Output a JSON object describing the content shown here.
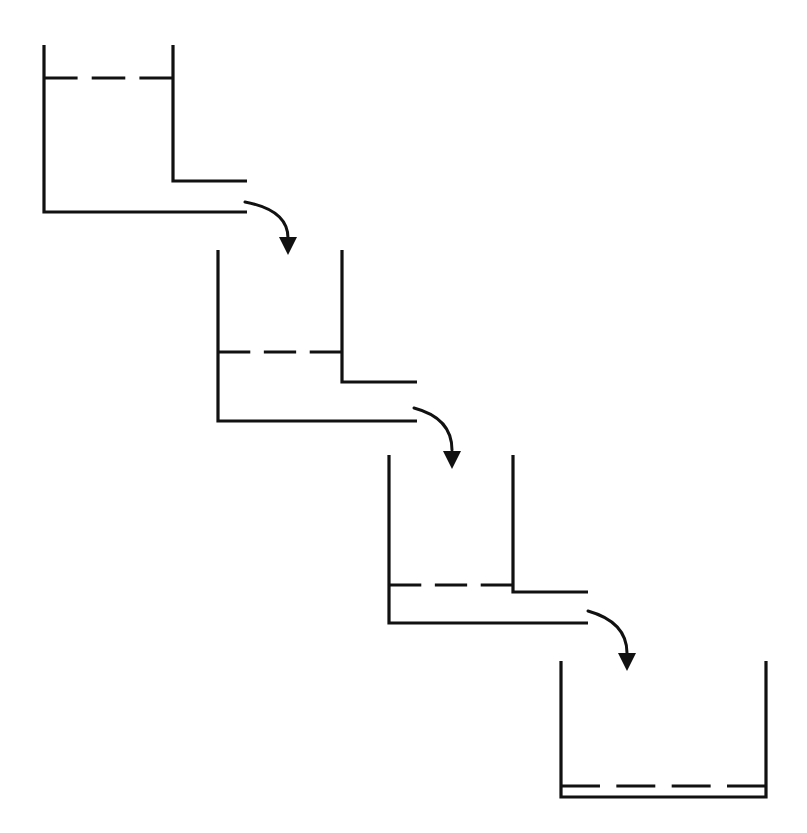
{
  "figure": {
    "type": "technical-line-diagram",
    "background_color": "#ffffff",
    "ink_color": "#111111",
    "width": 807,
    "height": 833
  },
  "style": {
    "wall_stroke_width": 3.2,
    "level_stroke_width": 3.2,
    "arrow_stroke_width": 3.0,
    "dash_pattern": "38 18"
  },
  "vessels": [
    {
      "id": "vessel-1",
      "label": "Vessel 1",
      "position": "top-left",
      "left_wall_x": 44,
      "right_wall_x": 173,
      "top_y": 45,
      "bottom_y": 212,
      "right_wall_bottom_y": 181,
      "spout_y": 181,
      "spout_end_x": 247,
      "bottom_end_x": 247,
      "level_y": 78,
      "level_dash_count": 3,
      "fill_depth_px": 134
    },
    {
      "id": "vessel-2",
      "label": "Vessel 2",
      "position": "upper-middle",
      "left_wall_x": 218,
      "right_wall_x": 342,
      "top_y": 250,
      "bottom_y": 421,
      "right_wall_bottom_y": 382,
      "spout_y": 382,
      "spout_end_x": 417,
      "bottom_end_x": 417,
      "level_y": 352,
      "level_dash_count": 3,
      "fill_depth_px": 69
    },
    {
      "id": "vessel-3",
      "label": "Vessel 3",
      "position": "lower-middle",
      "left_wall_x": 389,
      "right_wall_x": 513,
      "top_y": 455,
      "bottom_y": 623,
      "right_wall_bottom_y": 592,
      "spout_y": 592,
      "spout_end_x": 588,
      "bottom_end_x": 588,
      "level_y": 585,
      "level_dash_count": 3,
      "fill_depth_px": 38
    },
    {
      "id": "vessel-4",
      "label": "Vessel 4",
      "position": "bottom-right",
      "left_wall_x": 561,
      "right_wall_x": 766,
      "top_y": 661,
      "bottom_y": 797,
      "right_wall_bottom_y": 797,
      "spout_y": null,
      "spout_end_x": null,
      "bottom_end_x": 766,
      "level_y": 786,
      "level_dash_count": 4,
      "fill_depth_px": 11
    }
  ],
  "flow_arrows": [
    {
      "id": "flow-arrow-1",
      "label": "Flow from vessel 1 to vessel 2",
      "start_x": 245,
      "start_y": 202,
      "control_x": 288,
      "control_y": 210,
      "end_x": 288,
      "end_y": 238,
      "tip_x": 288,
      "tip_y": 255,
      "head_half_width": 9,
      "head_length": 18
    },
    {
      "id": "flow-arrow-2",
      "label": "Flow from vessel 2 to vessel 3",
      "start_x": 414,
      "start_y": 408,
      "control_x": 452,
      "control_y": 418,
      "end_x": 452,
      "end_y": 450,
      "tip_x": 452,
      "tip_y": 469,
      "head_half_width": 9,
      "head_length": 18
    },
    {
      "id": "flow-arrow-3",
      "label": "Flow from vessel 3 to vessel 4",
      "start_x": 588,
      "start_y": 611,
      "control_x": 627,
      "control_y": 622,
      "end_x": 627,
      "end_y": 653,
      "tip_x": 627,
      "tip_y": 671,
      "head_half_width": 9,
      "head_length": 18
    }
  ],
  "chart_data": {
    "type": "diagram",
    "categories": [
      "Vessel 1",
      "Vessel 2",
      "Vessel 3",
      "Vessel 4"
    ],
    "values": [
      134,
      69,
      38,
      11
    ],
    "value_units": "pixels of liquid depth",
    "xlabel": "Vessel in cascade",
    "ylabel": "Liquid depth"
  }
}
